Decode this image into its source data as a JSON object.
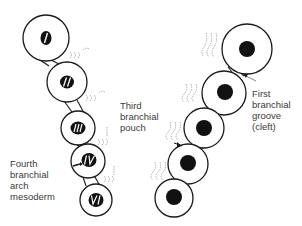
{
  "labels": {
    "third_pouch": [
      "Third",
      "branchial",
      "pouch"
    ],
    "fourth_arch": [
      "Fourth",
      "branchial",
      "arch",
      "mesoderm"
    ],
    "first_groove": [
      "First",
      "branchial",
      "groove",
      "(cleft)"
    ]
  },
  "left_chain": [
    {
      "numeral": "I",
      "cx": 46,
      "cy": 38,
      "r": 23
    },
    {
      "numeral": "II",
      "cx": 67,
      "cy": 82,
      "r": 20
    },
    {
      "numeral": "III",
      "cx": 78,
      "cy": 128,
      "r": 17
    },
    {
      "numeral": "IV",
      "cx": 88,
      "cy": 161,
      "r": 17
    },
    {
      "numeral": "VI",
      "cx": 96,
      "cy": 200,
      "r": 16
    }
  ],
  "right_chain": [
    {
      "cx": 247,
      "cy": 49,
      "r": 25,
      "nucleus_r": 8
    },
    {
      "cx": 224,
      "cy": 93,
      "r": 22,
      "nucleus_r": 8
    },
    {
      "cx": 204,
      "cy": 128,
      "r": 20,
      "nucleus_r": 8
    },
    {
      "cx": 188,
      "cy": 164,
      "r": 20,
      "nucleus_r": 8
    },
    {
      "cx": 174,
      "cy": 198,
      "r": 19,
      "nucleus_r": 8
    }
  ],
  "colors": {
    "stroke": "#1a1a1a",
    "fill": "#ffffff",
    "nucleus": "#111111",
    "wave": "#9a9a9a",
    "text": "#3a3a3a"
  }
}
